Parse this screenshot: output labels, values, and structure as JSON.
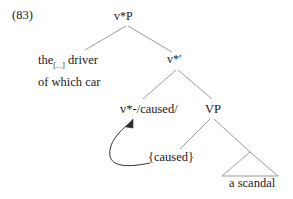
{
  "figure": {
    "example_number": "(83)",
    "type": "syntax-tree",
    "colors": {
      "text": "#1a1a1a",
      "branch_line": "#9a9a9a",
      "arrow": "#2b2b2b",
      "background": "#ffffff"
    }
  },
  "nodes": {
    "root": "v*P",
    "specifier_line1_pre": "the",
    "specifier_line1_sub": "[...]",
    "specifier_line1_post": " driver",
    "specifier_line2": "of which car",
    "vbar": "v*′",
    "little_v": "v*-/caused/",
    "vp": "VP",
    "caused_set": "{caused}",
    "complement_terminal": "a scandal"
  },
  "movement": {
    "arrow_name": "head-movement-arrow",
    "from": "{caused}",
    "to": "v*-/caused/"
  }
}
